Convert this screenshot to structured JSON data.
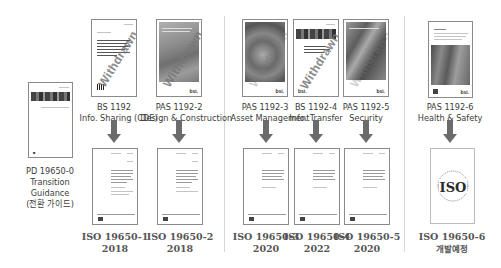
{
  "transition": {
    "code": "PD 19650-0",
    "line2": "Transition",
    "line3": "Guidance",
    "line4": "(전환 가이드)"
  },
  "watermark": "Withdrawn",
  "publisher_mark": "bsi.",
  "groups": [
    {
      "standards": [
        {
          "code": "BS 1192",
          "subtitle": "Info. Sharing (CDE)",
          "withdrawn": true,
          "iso": {
            "code": "ISO 19650-1",
            "year": "2018"
          }
        },
        {
          "code": "PAS 1192-2",
          "subtitle": "Design & Construction",
          "withdrawn": true,
          "iso": {
            "code": "ISO 19650-2",
            "year": "2018"
          }
        }
      ]
    },
    {
      "standards": [
        {
          "code": "PAS 1192-3",
          "subtitle": "Asset Management",
          "withdrawn": true,
          "iso": {
            "code": "ISO 19650-3",
            "year": "2020"
          }
        },
        {
          "code": "BS 1192-4",
          "subtitle": "Info. Transfer",
          "withdrawn": true,
          "iso": {
            "code": "ISO 19650-4",
            "year": "2022"
          }
        },
        {
          "code": "PAS 1192-5",
          "subtitle": "Security",
          "withdrawn": true,
          "iso": {
            "code": "ISO 19650-5",
            "year": "2020"
          }
        }
      ]
    },
    {
      "standards": [
        {
          "code": "PAS 1192-6",
          "subtitle": "Health & Safety",
          "withdrawn": false,
          "iso": {
            "code": "ISO 19650-6",
            "year": "개발예정",
            "logo": "ISO"
          }
        }
      ]
    }
  ],
  "colors": {
    "arrow": "#6b6b6b",
    "separator": "#d6d6d6",
    "cover_border": "#8a8a8a"
  }
}
